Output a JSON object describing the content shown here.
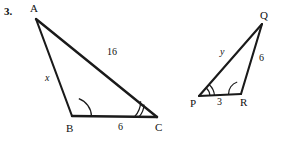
{
  "problem": {
    "number": "3."
  },
  "figure": {
    "stroke_color": "#1a1a1a",
    "background_color": "#ffffff",
    "triangles": [
      {
        "name": "large-triangle-abc",
        "vertices": [
          {
            "label": "A",
            "x": 36,
            "y": 19
          },
          {
            "label": "B",
            "x": 72,
            "y": 116
          },
          {
            "label": "C",
            "x": 157,
            "y": 117
          }
        ],
        "sides": [
          {
            "name": "side-ab",
            "label": "x",
            "italic": true
          },
          {
            "name": "side-ac",
            "label": "16",
            "italic": false
          },
          {
            "name": "side-bc",
            "label": "6",
            "italic": false
          }
        ],
        "angle_marks": [
          {
            "name": "angle-b",
            "arcs": 1
          },
          {
            "name": "angle-c",
            "arcs": 2
          }
        ]
      },
      {
        "name": "small-triangle-pqr",
        "vertices": [
          {
            "label": "P",
            "x": 199,
            "y": 96
          },
          {
            "label": "Q",
            "x": 262,
            "y": 24
          },
          {
            "label": "R",
            "x": 241,
            "y": 94
          }
        ],
        "sides": [
          {
            "name": "side-pq",
            "label": "y",
            "italic": true
          },
          {
            "name": "side-qr",
            "label": "6",
            "italic": false
          },
          {
            "name": "side-pr",
            "label": "3",
            "italic": false
          }
        ],
        "angle_marks": [
          {
            "name": "angle-p",
            "arcs": 2
          },
          {
            "name": "angle-r",
            "arcs": 1
          }
        ]
      }
    ]
  },
  "labels": {
    "A": "A",
    "B": "B",
    "C": "C",
    "P": "P",
    "Q": "Q",
    "R": "R",
    "x": "x",
    "y": "y",
    "sixteen": "16",
    "six_bc": "6",
    "six_qr": "6",
    "three_pr": "3"
  }
}
